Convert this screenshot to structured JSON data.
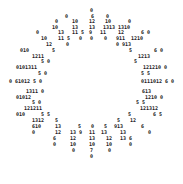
{
  "figure": {
    "text_color": "#222222",
    "background": "#ffffff"
  },
  "labels": [
    {
      "x": 90,
      "y": 8,
      "text": "0"
    },
    {
      "x": 65,
      "y": 14,
      "text": "0"
    },
    {
      "x": 91,
      "y": 14,
      "text": "6"
    },
    {
      "x": 106,
      "y": 14,
      "text": "0"
    },
    {
      "x": 55,
      "y": 19,
      "text": "0"
    },
    {
      "x": 72,
      "y": 19,
      "text": "10"
    },
    {
      "x": 89,
      "y": 19,
      "text": "12"
    },
    {
      "x": 105,
      "y": 19,
      "text": "10"
    },
    {
      "x": 128,
      "y": 19,
      "text": "0"
    },
    {
      "x": 52,
      "y": 25,
      "text": "10"
    },
    {
      "x": 72,
      "y": 25,
      "text": "13"
    },
    {
      "x": 89,
      "y": 25,
      "text": "13"
    },
    {
      "x": 103,
      "y": 25,
      "text": "1313"
    },
    {
      "x": 118,
      "y": 25,
      "text": "1310"
    },
    {
      "x": 36,
      "y": 30,
      "text": "0"
    },
    {
      "x": 58,
      "y": 30,
      "text": "13"
    },
    {
      "x": 72,
      "y": 30,
      "text": "11 5"
    },
    {
      "x": 89,
      "y": 30,
      "text": "9"
    },
    {
      "x": 100,
      "y": 30,
      "text": "11"
    },
    {
      "x": 118,
      "y": 30,
      "text": "12"
    },
    {
      "x": 141,
      "y": 30,
      "text": "6 0"
    },
    {
      "x": 41,
      "y": 36,
      "text": "10"
    },
    {
      "x": 58,
      "y": 36,
      "text": "11 5"
    },
    {
      "x": 79,
      "y": 36,
      "text": "0"
    },
    {
      "x": 90,
      "y": 36,
      "text": "0"
    },
    {
      "x": 104,
      "y": 36,
      "text": "0"
    },
    {
      "x": 116,
      "y": 36,
      "text": "911"
    },
    {
      "x": 131,
      "y": 36,
      "text": "1210"
    },
    {
      "x": 46,
      "y": 42,
      "text": "12"
    },
    {
      "x": 66,
      "y": 42,
      "text": "0"
    },
    {
      "x": 116,
      "y": 42,
      "text": "0"
    },
    {
      "x": 122,
      "y": 42,
      "text": "913"
    },
    {
      "x": 20,
      "y": 48,
      "text": "010"
    },
    {
      "x": 52,
      "y": 48,
      "text": "5"
    },
    {
      "x": 129,
      "y": 48,
      "text": "5"
    },
    {
      "x": 154,
      "y": 48,
      "text": "6 0"
    },
    {
      "x": 32,
      "y": 54,
      "text": "1211"
    },
    {
      "x": 138,
      "y": 54,
      "text": "1213"
    },
    {
      "x": 41,
      "y": 59,
      "text": "5 0"
    },
    {
      "x": 134,
      "y": 59,
      "text": "5"
    },
    {
      "x": 16,
      "y": 65,
      "text": "0101311"
    },
    {
      "x": 143,
      "y": 65,
      "text": "121210 0"
    },
    {
      "x": 38,
      "y": 71,
      "text": "5 0"
    },
    {
      "x": 141,
      "y": 71,
      "text": "5 5"
    },
    {
      "x": 9,
      "y": 79,
      "text": "0 61012 5 0"
    },
    {
      "x": 141,
      "y": 79,
      "text": "0111012 6 0"
    },
    {
      "x": 26,
      "y": 89,
      "text": "1311 0"
    },
    {
      "x": 142,
      "y": 89,
      "text": "613"
    },
    {
      "x": 16,
      "y": 95,
      "text": "01012"
    },
    {
      "x": 145,
      "y": 95,
      "text": "1210 0"
    },
    {
      "x": 32,
      "y": 100,
      "text": "5 0"
    },
    {
      "x": 136,
      "y": 100,
      "text": "5 5"
    },
    {
      "x": 24,
      "y": 106,
      "text": "121211"
    },
    {
      "x": 140,
      "y": 106,
      "text": "121312"
    },
    {
      "x": 16,
      "y": 112,
      "text": "010"
    },
    {
      "x": 41,
      "y": 112,
      "text": "5 5"
    },
    {
      "x": 128,
      "y": 112,
      "text": "5"
    },
    {
      "x": 153,
      "y": 112,
      "text": "6 5"
    },
    {
      "x": 32,
      "y": 118,
      "text": "1312"
    },
    {
      "x": 55,
      "y": 118,
      "text": "5"
    },
    {
      "x": 117,
      "y": 118,
      "text": "5"
    },
    {
      "x": 130,
      "y": 118,
      "text": "12"
    },
    {
      "x": 32,
      "y": 124,
      "text": "610"
    },
    {
      "x": 55,
      "y": 124,
      "text": "13"
    },
    {
      "x": 78,
      "y": 124,
      "text": "5"
    },
    {
      "x": 91,
      "y": 124,
      "text": "0"
    },
    {
      "x": 104,
      "y": 124,
      "text": "5"
    },
    {
      "x": 114,
      "y": 124,
      "text": "913"
    },
    {
      "x": 141,
      "y": 124,
      "text": "6"
    },
    {
      "x": 32,
      "y": 130,
      "text": "0"
    },
    {
      "x": 55,
      "y": 130,
      "text": "12"
    },
    {
      "x": 70,
      "y": 130,
      "text": "13 9"
    },
    {
      "x": 89,
      "y": 130,
      "text": "11"
    },
    {
      "x": 101,
      "y": 130,
      "text": "13"
    },
    {
      "x": 120,
      "y": 130,
      "text": "13"
    },
    {
      "x": 148,
      "y": 130,
      "text": "0"
    },
    {
      "x": 53,
      "y": 136,
      "text": "6"
    },
    {
      "x": 70,
      "y": 136,
      "text": "12"
    },
    {
      "x": 89,
      "y": 136,
      "text": "13"
    },
    {
      "x": 106,
      "y": 136,
      "text": "12"
    },
    {
      "x": 120,
      "y": 136,
      "text": "13 6"
    },
    {
      "x": 53,
      "y": 142,
      "text": "0"
    },
    {
      "x": 70,
      "y": 142,
      "text": "10"
    },
    {
      "x": 89,
      "y": 142,
      "text": "10"
    },
    {
      "x": 106,
      "y": 142,
      "text": "10"
    },
    {
      "x": 129,
      "y": 142,
      "text": "0"
    },
    {
      "x": 72,
      "y": 148,
      "text": "0"
    },
    {
      "x": 90,
      "y": 148,
      "text": "7"
    },
    {
      "x": 108,
      "y": 148,
      "text": "0"
    },
    {
      "x": 90,
      "y": 154,
      "text": "0"
    }
  ]
}
